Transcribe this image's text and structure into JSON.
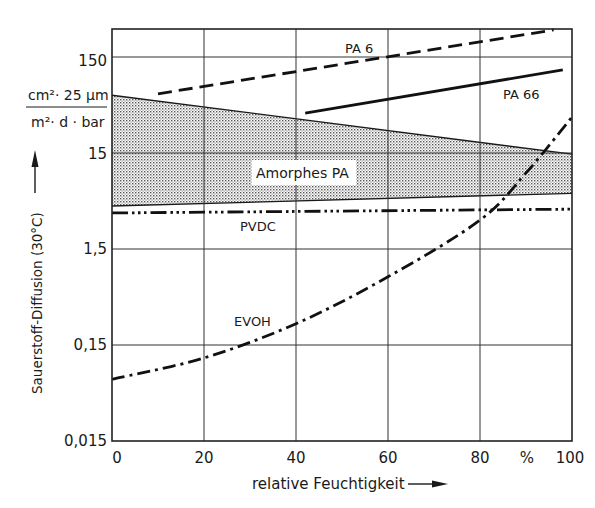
{
  "chart_data": {
    "type": "line",
    "title": "",
    "xlabel": "relative Feuchtigkeit",
    "xunit": "%",
    "ylabel": "Sauerstoff-Diffusion (30°C)",
    "yunit": {
      "numerator": "cm²· 25 µm",
      "denominator": "m²· d · bar"
    },
    "xscale": "linear",
    "yscale": "log",
    "xlim": [
      0,
      100
    ],
    "ylim": [
      0.015,
      400
    ],
    "x_ticks": [
      "0",
      "20",
      "40",
      "60",
      "80",
      "100"
    ],
    "y_ticks": [
      "0,015",
      "0,15",
      "1,5",
      "15",
      "150"
    ],
    "grid": true,
    "legend": "inline labels",
    "series": [
      {
        "name": "PA 6",
        "style": "dashed",
        "x": [
          10,
          96
        ],
        "values": [
          62,
          287
        ]
      },
      {
        "name": "PA 66",
        "style": "solid",
        "x": [
          42,
          98
        ],
        "values": [
          39,
          110
        ]
      },
      {
        "name": "Amorphes PA",
        "style": "shaded band",
        "x": [
          0,
          100
        ],
        "upper": [
          60,
          14.6
        ],
        "lower": [
          4.2,
          5.7
        ]
      },
      {
        "name": "PVDC",
        "style": "dash-dot-dot",
        "x": [
          0,
          100
        ],
        "values": [
          3.56,
          3.9
        ]
      },
      {
        "name": "EVOH",
        "style": "dash-dot",
        "x": [
          0,
          20,
          40,
          60,
          80,
          90,
          100
        ],
        "values": [
          0.066,
          0.11,
          0.25,
          0.77,
          3.0,
          9.3,
          35.5
        ]
      }
    ]
  }
}
